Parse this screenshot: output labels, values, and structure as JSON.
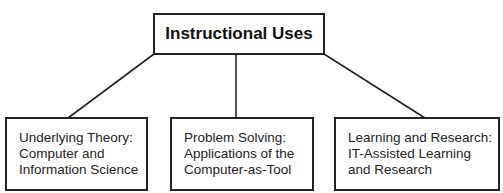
{
  "diagram": {
    "type": "hierarchy",
    "root": {
      "label": "Instructional Uses"
    },
    "children": [
      {
        "lines": [
          "Underlying Theory:",
          "Computer and",
          "Information Science"
        ]
      },
      {
        "lines": [
          "Problem Solving:",
          "Applications of the",
          "Computer-as-Tool"
        ]
      },
      {
        "lines": [
          "Learning and Research:",
          "IT-Assisted Learning",
          "and Research"
        ]
      }
    ],
    "edges": [
      {
        "from": "root",
        "to": "children.0"
      },
      {
        "from": "root",
        "to": "children.1"
      },
      {
        "from": "root",
        "to": "children.2"
      }
    ],
    "colors": {
      "stroke": "#222222",
      "background": "#ffffff",
      "text": "#1a1a1a"
    }
  }
}
